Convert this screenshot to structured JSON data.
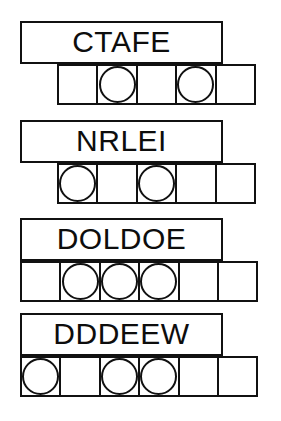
{
  "page": {
    "background_color": "#ffffff",
    "ink_color": "#111111",
    "width": 281,
    "height": 421
  },
  "puzzles": [
    {
      "id": "puzzle-1",
      "scrambled_word": "CTAFE",
      "letter_count": 5,
      "cell_count": 5,
      "circled_cell_indices": [
        1,
        3
      ],
      "word_box": {
        "left": 20,
        "top": 21,
        "width": 203,
        "height": 43
      },
      "cell_row": {
        "left": 57,
        "top": 64
      },
      "cells": [
        {
          "index": 0,
          "circled": false
        },
        {
          "index": 1,
          "circled": true
        },
        {
          "index": 2,
          "circled": false
        },
        {
          "index": 3,
          "circled": true
        },
        {
          "index": 4,
          "circled": false
        }
      ]
    },
    {
      "id": "puzzle-2",
      "scrambled_word": "NRLEI",
      "letter_count": 5,
      "cell_count": 5,
      "circled_cell_indices": [
        0,
        2
      ],
      "word_box": {
        "left": 20,
        "top": 120,
        "width": 203,
        "height": 43
      },
      "cell_row": {
        "left": 57,
        "top": 163
      },
      "cells": [
        {
          "index": 0,
          "circled": true
        },
        {
          "index": 1,
          "circled": false
        },
        {
          "index": 2,
          "circled": true
        },
        {
          "index": 3,
          "circled": false
        },
        {
          "index": 4,
          "circled": false
        }
      ]
    },
    {
      "id": "puzzle-3",
      "scrambled_word": "DOLDOE",
      "letter_count": 6,
      "cell_count": 6,
      "circled_cell_indices": [
        1,
        2,
        3
      ],
      "word_box": {
        "left": 20,
        "top": 218,
        "width": 203,
        "height": 43
      },
      "cell_row": {
        "left": 20,
        "top": 261
      },
      "cells": [
        {
          "index": 0,
          "circled": false
        },
        {
          "index": 1,
          "circled": true
        },
        {
          "index": 2,
          "circled": true
        },
        {
          "index": 3,
          "circled": true
        },
        {
          "index": 4,
          "circled": false
        },
        {
          "index": 5,
          "circled": false
        }
      ]
    },
    {
      "id": "puzzle-4",
      "scrambled_word": "DDDEEW",
      "letter_count": 6,
      "cell_count": 6,
      "circled_cell_indices": [
        0,
        2,
        3
      ],
      "word_box": {
        "left": 20,
        "top": 313,
        "width": 203,
        "height": 43
      },
      "cell_row": {
        "left": 20,
        "top": 356
      },
      "cells": [
        {
          "index": 0,
          "circled": true
        },
        {
          "index": 1,
          "circled": false
        },
        {
          "index": 2,
          "circled": true
        },
        {
          "index": 3,
          "circled": true
        },
        {
          "index": 4,
          "circled": false
        },
        {
          "index": 5,
          "circled": false
        }
      ]
    }
  ]
}
